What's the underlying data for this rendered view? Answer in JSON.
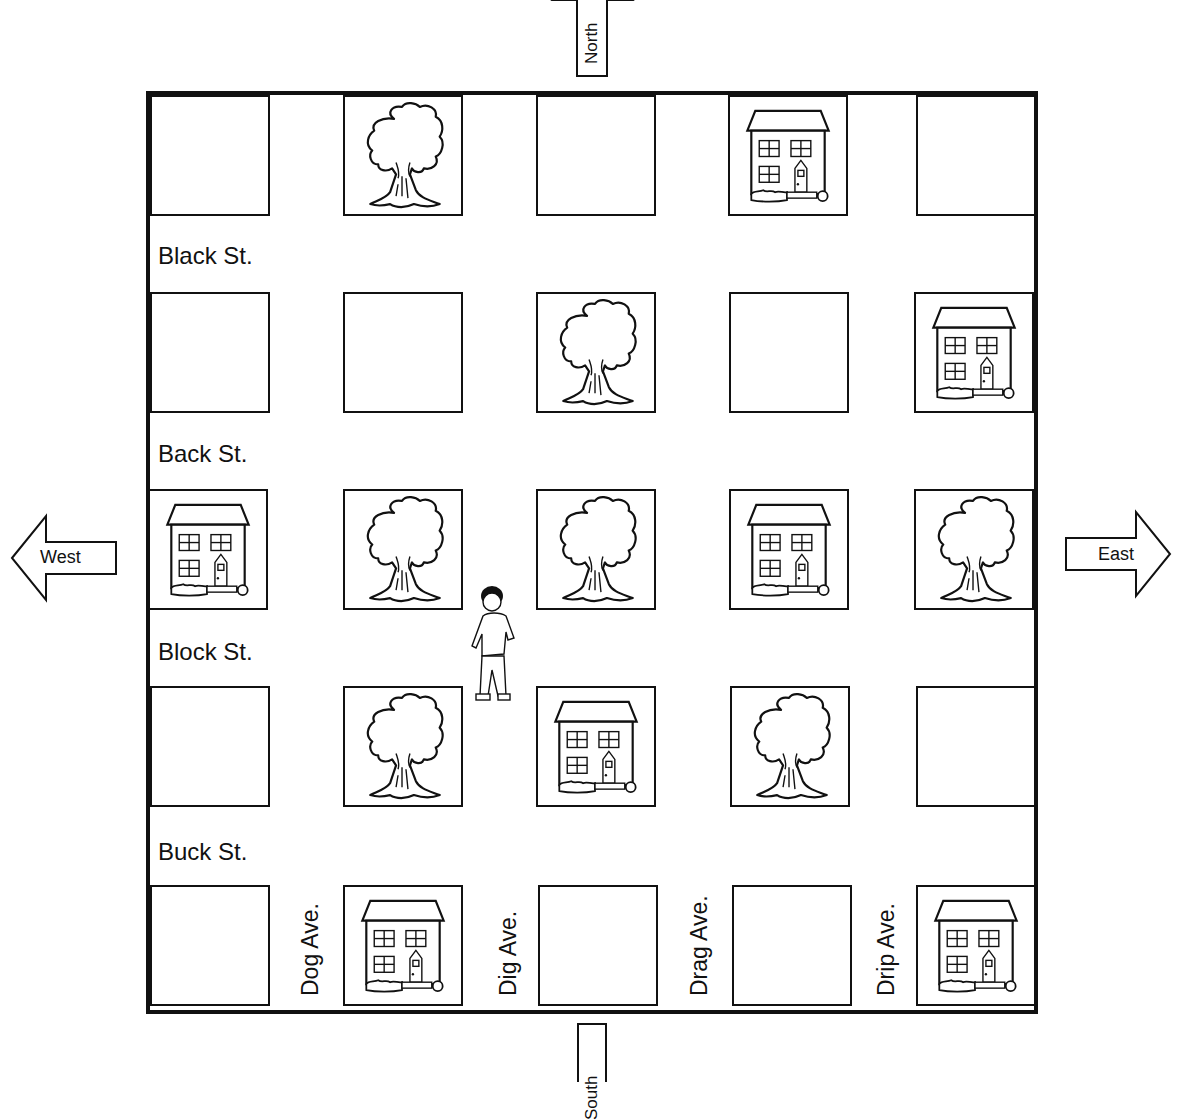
{
  "compass": {
    "north": "North",
    "south": "South",
    "east": "East",
    "west": "West"
  },
  "streets": [
    {
      "name": "Black St.",
      "top": 240
    },
    {
      "name": "Back St.",
      "top": 438
    },
    {
      "name": "Block St.",
      "top": 636
    },
    {
      "name": "Buck St.",
      "top": 836
    }
  ],
  "avenues": [
    {
      "name": "Dog Ave.",
      "left": 296
    },
    {
      "name": "Dig Ave.",
      "left": 494
    },
    {
      "name": "Drag Ave.",
      "left": 686
    },
    {
      "name": "Drip Ave.",
      "left": 873
    }
  ],
  "grid": {
    "rows": [
      [
        "empty",
        "tree",
        "empty",
        "house",
        "empty"
      ],
      [
        "empty",
        "empty",
        "tree",
        "empty",
        "house"
      ],
      [
        "house",
        "tree",
        "tree",
        "house",
        "tree"
      ],
      [
        "empty",
        "tree",
        "house",
        "tree",
        "empty"
      ],
      [
        "empty",
        "house",
        "empty",
        "empty",
        "house"
      ]
    ]
  },
  "person": {
    "label": "boy",
    "location": "Dig Ave. between Block St. and Buck St."
  }
}
